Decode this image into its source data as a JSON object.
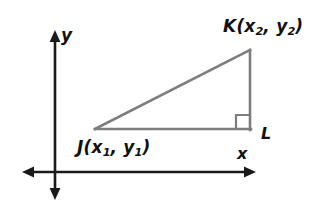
{
  "figure": {
    "type": "geometry-diagram",
    "background_color": "#ffffff",
    "axes": {
      "color": "#1a1a1a",
      "stroke_width": 2.6,
      "origin": {
        "x": 55,
        "y": 172
      },
      "x_axis": {
        "label": "x",
        "from": {
          "x": 22,
          "y": 172
        },
        "to": {
          "x": 256,
          "y": 172
        },
        "arrow_start": true,
        "arrow_end": true
      },
      "y_axis": {
        "label": "y",
        "from": {
          "x": 55,
          "y": 200
        },
        "to": {
          "x": 55,
          "y": 30
        },
        "arrow_start": true,
        "arrow_end": true
      }
    },
    "triangle": {
      "stroke_color": "#7d7d7d",
      "stroke_width": 2.6,
      "fill": "none",
      "vertices": [
        {
          "name": "J",
          "label": "J(x1, y1)",
          "x": 95,
          "y": 129
        },
        {
          "name": "K",
          "label": "K(x2, y2)",
          "x": 250,
          "y": 50
        },
        {
          "name": "L",
          "label": "L",
          "x": 250,
          "y": 129
        }
      ],
      "sides": [
        {
          "from": "J",
          "to": "K",
          "role": "hypotenuse"
        },
        {
          "from": "K",
          "to": "L",
          "role": "vertical-leg"
        },
        {
          "from": "L",
          "to": "J",
          "role": "horizontal-leg"
        }
      ],
      "right_angle": {
        "at_vertex": "L",
        "marker": "square",
        "size": 13,
        "stroke_color": "#7d7d7d",
        "stroke_width": 2.2
      }
    },
    "labels": {
      "k_point": {
        "letter": "K",
        "open_paren": "(",
        "x_var": "x",
        "x_sub": "2",
        "comma": ", ",
        "y_var": "y",
        "y_sub": "2",
        "close_paren": ")"
      },
      "j_point": {
        "letter": "J",
        "open_paren": "(",
        "x_var": "x",
        "x_sub": "1",
        "comma": ", ",
        "y_var": "y",
        "y_sub": "1",
        "close_paren": ")"
      },
      "l_point": "L",
      "x_axis": "x",
      "y_axis": "y"
    }
  }
}
